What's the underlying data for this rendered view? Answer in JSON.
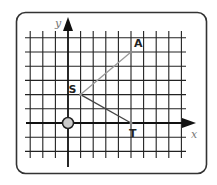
{
  "diagram": {
    "type": "coordinate-grid",
    "frame": {
      "border_color": "#333333",
      "background": "#ffffff"
    },
    "grid": {
      "x_range": [
        -3,
        9
      ],
      "y_range": [
        -3,
        6
      ],
      "line_color": "#222222"
    },
    "axes": {
      "x_label": "x",
      "y_label": "y",
      "color": "#111111"
    },
    "origin_marker": {
      "fill": "#cccccc",
      "stroke": "#222222"
    },
    "points": [
      {
        "name": "S",
        "label": "S",
        "x": 1,
        "y": 2
      },
      {
        "name": "A",
        "label": "A",
        "x": 5,
        "y": 5
      },
      {
        "name": "T",
        "label": "T",
        "x": 5,
        "y": 0
      }
    ],
    "segments": [
      {
        "from": "S",
        "to": "A",
        "color": "#999999"
      },
      {
        "from": "S",
        "to": "T",
        "color": "#444444"
      }
    ]
  }
}
